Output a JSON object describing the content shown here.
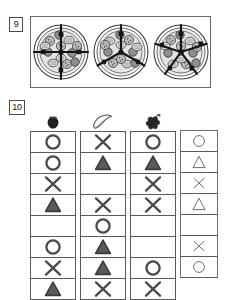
{
  "page": {
    "background": "#ffffff",
    "ink": "#404040"
  },
  "exercises": [
    {
      "number": "9",
      "name": "pizza-fraction-exercise",
      "items": [
        {
          "name": "pizza-quarters",
          "slices": 4,
          "icon": "pizza-icon"
        },
        {
          "name": "pizza-thirds",
          "slices": 3,
          "icon": "pizza-icon"
        },
        {
          "name": "pizza-fifths",
          "slices": 5,
          "icon": "pizza-icon"
        }
      ]
    },
    {
      "number": "10",
      "name": "fruit-symbol-table-exercise",
      "columns": [
        {
          "name": "column-strawberry",
          "header_icon": "strawberry-icon",
          "header_label": "strawberry",
          "style": "bold",
          "cells": [
            "circle",
            "circle",
            "cross",
            "triangle",
            "blank",
            "circle",
            "cross",
            "triangle"
          ]
        },
        {
          "name": "column-banana",
          "header_icon": "banana-icon",
          "header_label": "banana",
          "style": "bold",
          "cells": [
            "cross",
            "triangle",
            "blank",
            "cross",
            "circle",
            "triangle",
            "triangle",
            "cross"
          ]
        },
        {
          "name": "column-grapes",
          "header_icon": "grapes-icon",
          "header_label": "grapes",
          "style": "bold",
          "cells": [
            "circle",
            "triangle",
            "cross",
            "cross",
            "blank",
            "blank",
            "circle",
            "cross"
          ]
        },
        {
          "name": "column-answer-key",
          "header_icon": "none",
          "header_label": "",
          "style": "light",
          "cells": [
            "circle",
            "triangle",
            "cross",
            "triangle",
            "blank",
            "cross",
            "circle"
          ]
        }
      ],
      "symbol_legend": {
        "circle": "circle-symbol",
        "triangle": "triangle-symbol",
        "cross": "cross-symbol",
        "blank": "blank-cell"
      }
    }
  ]
}
